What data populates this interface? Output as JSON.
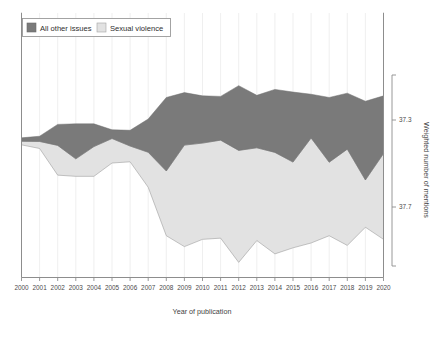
{
  "chart_data": {
    "type": "area",
    "subtype": "streamgraph",
    "title": "",
    "xlabel": "Year of publication",
    "ylabel": "Weighted number of mentions",
    "grid": true,
    "grid_axis": "x",
    "legend_position": "top-left",
    "baseline": "wiggle",
    "x": [
      2000,
      2001,
      2002,
      2003,
      2004,
      2005,
      2006,
      2007,
      2008,
      2009,
      2010,
      2011,
      2012,
      2013,
      2014,
      2015,
      2016,
      2017,
      2018,
      2019,
      2020
    ],
    "categories": [
      "2000",
      "2001",
      "2002",
      "2003",
      "2004",
      "2005",
      "2006",
      "2007",
      "2008",
      "2009",
      "2010",
      "2011",
      "2012",
      "2013",
      "2014",
      "2015",
      "2016",
      "2017",
      "2018",
      "2019",
      "2020"
    ],
    "xlim": [
      2000,
      2020
    ],
    "ylim": [
      37.15,
      37.95
    ],
    "ytick_values": [
      37.3,
      37.7
    ],
    "ytick_labels": [
      "37.3",
      "37.7"
    ],
    "yaxis_side": "right",
    "series": [
      {
        "name": "All other issues",
        "color": "#7a7a7a",
        "values": [
          0.02,
          0.03,
          0.12,
          0.2,
          0.13,
          0.05,
          0.09,
          0.19,
          0.42,
          0.3,
          0.27,
          0.25,
          0.37,
          0.3,
          0.36,
          0.4,
          0.25,
          0.37,
          0.32,
          0.45,
          0.33
        ]
      },
      {
        "name": "Sexual violence",
        "color": "#e2e2e2",
        "values": [
          0.02,
          0.04,
          0.17,
          0.1,
          0.17,
          0.14,
          0.09,
          0.2,
          0.37,
          0.58,
          0.55,
          0.56,
          0.64,
          0.53,
          0.58,
          0.49,
          0.6,
          0.42,
          0.55,
          0.27,
          0.49
        ]
      }
    ]
  },
  "legend": {
    "items": [
      {
        "label": "All other issues",
        "swatch": "#7a7a7a"
      },
      {
        "label": "Sexual violence",
        "swatch": "#e2e2e2"
      }
    ]
  },
  "axes": {
    "x_title": "Year of publication",
    "y_title": "Weighted number of mentions",
    "x_ticks": [
      "2000",
      "2001",
      "2002",
      "2003",
      "2004",
      "2005",
      "2006",
      "2007",
      "2008",
      "2009",
      "2010",
      "2011",
      "2012",
      "2013",
      "2014",
      "2015",
      "2016",
      "2017",
      "2018",
      "2019",
      "2020"
    ],
    "y_ticks": [
      "37.3",
      "37.7"
    ]
  },
  "colors": {
    "series_dark": "#7a7a7a",
    "series_light": "#e2e2e2",
    "stroke_light": "#9a9a9a",
    "frame": "#8d8d8d",
    "gridline": "#ebebeb",
    "background": "#ffffff"
  }
}
